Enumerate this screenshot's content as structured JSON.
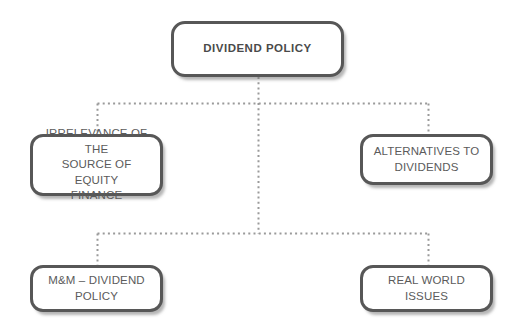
{
  "diagram": {
    "title": "DIVIDEND POLICY",
    "background_color": "#ffffff",
    "box_border_color": "#575757",
    "box_fill_color": "#ffffff",
    "text_color": "#5b5b5b",
    "connector_color": "#9a9a9a",
    "connector_style": "dotted",
    "nodes": {
      "root": {
        "label": "DIVIDEND POLICY"
      },
      "irrelevance": {
        "label": "IRRELEVANCE OF THE\nSOURCE OF EQUITY\nFINANCE"
      },
      "alternatives": {
        "label": "ALTERNATIVES TO\nDIVIDENDS"
      },
      "mm_dividend": {
        "label": "M&M – DIVIDEND\nPOLICY"
      },
      "real_world": {
        "label": "REAL WORLD\nISSUES"
      }
    }
  }
}
